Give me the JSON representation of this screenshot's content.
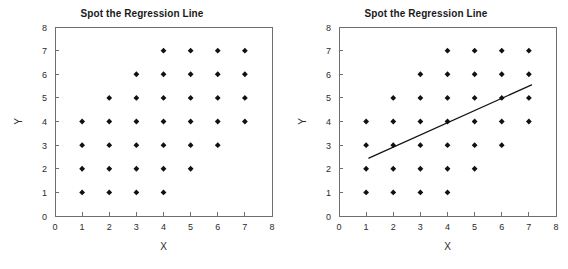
{
  "figure": {
    "width": 568,
    "height": 269,
    "background_color": "#ffffff",
    "marker_color": "#111111",
    "line_color": "#111111",
    "axis_color": "#6e6e6e",
    "text_color": "#2b2b2b"
  },
  "chart_data": [
    {
      "type": "scatter",
      "panel": "left",
      "title": "Spot the Regression Line",
      "xlabel": "X",
      "ylabel": "Y",
      "xlim": [
        0,
        8
      ],
      "ylim": [
        0,
        8
      ],
      "xticks": [
        "0",
        "1",
        "2",
        "3",
        "4",
        "5",
        "6",
        "7",
        "8"
      ],
      "yticks": [
        "0",
        "1",
        "2",
        "3",
        "4",
        "5",
        "6",
        "7",
        "8"
      ],
      "grid": false,
      "legend": null,
      "marker": "diamond",
      "points": [
        {
          "x": 4,
          "y": 7
        },
        {
          "x": 5,
          "y": 7
        },
        {
          "x": 6,
          "y": 7
        },
        {
          "x": 7,
          "y": 7
        },
        {
          "x": 3,
          "y": 6
        },
        {
          "x": 4,
          "y": 6
        },
        {
          "x": 5,
          "y": 6
        },
        {
          "x": 6,
          "y": 6
        },
        {
          "x": 7,
          "y": 6
        },
        {
          "x": 2,
          "y": 5
        },
        {
          "x": 3,
          "y": 5
        },
        {
          "x": 4,
          "y": 5
        },
        {
          "x": 5,
          "y": 5
        },
        {
          "x": 6,
          "y": 5
        },
        {
          "x": 7,
          "y": 5
        },
        {
          "x": 1,
          "y": 4
        },
        {
          "x": 2,
          "y": 4
        },
        {
          "x": 3,
          "y": 4
        },
        {
          "x": 4,
          "y": 4
        },
        {
          "x": 5,
          "y": 4
        },
        {
          "x": 6,
          "y": 4
        },
        {
          "x": 7,
          "y": 4
        },
        {
          "x": 1,
          "y": 3
        },
        {
          "x": 2,
          "y": 3
        },
        {
          "x": 3,
          "y": 3
        },
        {
          "x": 4,
          "y": 3
        },
        {
          "x": 5,
          "y": 3
        },
        {
          "x": 6,
          "y": 3
        },
        {
          "x": 1,
          "y": 2
        },
        {
          "x": 2,
          "y": 2
        },
        {
          "x": 3,
          "y": 2
        },
        {
          "x": 4,
          "y": 2
        },
        {
          "x": 5,
          "y": 2
        },
        {
          "x": 1,
          "y": 1
        },
        {
          "x": 2,
          "y": 1
        },
        {
          "x": 3,
          "y": 1
        },
        {
          "x": 4,
          "y": 1
        }
      ],
      "trendline": null
    },
    {
      "type": "scatter",
      "panel": "right",
      "title": "Spot the Regression Line",
      "xlabel": "X",
      "ylabel": "Y",
      "xlim": [
        0,
        8
      ],
      "ylim": [
        0,
        8
      ],
      "xticks": [
        "0",
        "1",
        "2",
        "3",
        "4",
        "5",
        "6",
        "7",
        "8"
      ],
      "yticks": [
        "0",
        "1",
        "2",
        "3",
        "4",
        "5",
        "6",
        "7",
        "8"
      ],
      "grid": false,
      "legend": null,
      "marker": "diamond",
      "points": [
        {
          "x": 4,
          "y": 7
        },
        {
          "x": 5,
          "y": 7
        },
        {
          "x": 6,
          "y": 7
        },
        {
          "x": 7,
          "y": 7
        },
        {
          "x": 3,
          "y": 6
        },
        {
          "x": 4,
          "y": 6
        },
        {
          "x": 5,
          "y": 6
        },
        {
          "x": 6,
          "y": 6
        },
        {
          "x": 7,
          "y": 6
        },
        {
          "x": 2,
          "y": 5
        },
        {
          "x": 3,
          "y": 5
        },
        {
          "x": 4,
          "y": 5
        },
        {
          "x": 5,
          "y": 5
        },
        {
          "x": 6,
          "y": 5
        },
        {
          "x": 7,
          "y": 5
        },
        {
          "x": 1,
          "y": 4
        },
        {
          "x": 2,
          "y": 4
        },
        {
          "x": 3,
          "y": 4
        },
        {
          "x": 4,
          "y": 4
        },
        {
          "x": 5,
          "y": 4
        },
        {
          "x": 6,
          "y": 4
        },
        {
          "x": 7,
          "y": 4
        },
        {
          "x": 1,
          "y": 3
        },
        {
          "x": 2,
          "y": 3
        },
        {
          "x": 3,
          "y": 3
        },
        {
          "x": 4,
          "y": 3
        },
        {
          "x": 5,
          "y": 3
        },
        {
          "x": 6,
          "y": 3
        },
        {
          "x": 1,
          "y": 2
        },
        {
          "x": 2,
          "y": 2
        },
        {
          "x": 3,
          "y": 2
        },
        {
          "x": 4,
          "y": 2
        },
        {
          "x": 5,
          "y": 2
        },
        {
          "x": 1,
          "y": 1
        },
        {
          "x": 2,
          "y": 1
        },
        {
          "x": 3,
          "y": 1
        },
        {
          "x": 4,
          "y": 1
        }
      ],
      "trendline": {
        "slope": 0.5,
        "intercept": 2.0,
        "x_start": 1.1,
        "y_start": 2.45,
        "x_end": 7.1,
        "y_end": 5.55
      }
    }
  ]
}
